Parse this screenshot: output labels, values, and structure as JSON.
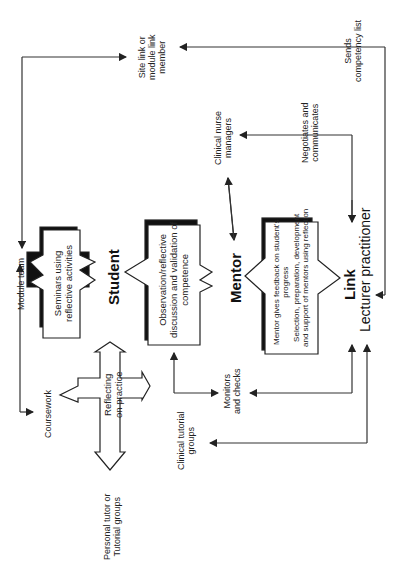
{
  "diagram": {
    "orientation": "rotated-90-ccw",
    "nodes": {
      "site_link": "Site link or\nmodule link\nmember",
      "clinical_nurse_managers": "Clinical nurse\nmanagers",
      "module_team": "Module team",
      "student": "Student",
      "mentor": "Mentor",
      "link": "Link",
      "lecturer_practitioner": "Lecturer practitioner",
      "coursework": "Coursework",
      "personal_tutor": "Personal tutor or\nTutorial groups",
      "clinical_tutorial_groups": "Clinical tutorial\ngroups"
    },
    "boxes": {
      "seminars": "Seminars using\nreflective activities",
      "observation": "Observation/reflective\ndiscussion and validation of\ncompetence",
      "mentor_box_line1": "Mentor gives feedback on student's\nprogress",
      "mentor_box_line2": "Selection, preparation, development\nand support of mentors using reflection",
      "reflecting": "Reflecting\non practice"
    },
    "edge_labels": {
      "sends_competency": "Sends\ncompetency list",
      "negotiates": "Negotiates and\ncommunicates",
      "monitors": "Monitors\nand checks"
    }
  }
}
